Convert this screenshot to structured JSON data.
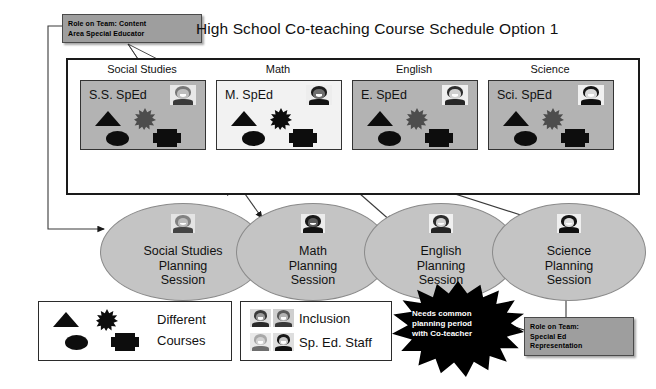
{
  "page_title": "High School Co-teaching Course Schedule Option 1",
  "role_top": {
    "line1": "Role on Team: Content",
    "line2": "Area Special Educator"
  },
  "role_bottom": {
    "line1": "Role on Team:",
    "line2": "Special Ed",
    "line3": "Representation"
  },
  "subjects": [
    {
      "label": "Social Studies",
      "card_label": "S.S. SpEd",
      "card_style": "gray"
    },
    {
      "label": "Math",
      "card_label": "M. SpEd",
      "card_style": "light"
    },
    {
      "label": "English",
      "card_label": "E. SpEd",
      "card_style": "gray"
    },
    {
      "label": "Science",
      "card_label": "Sci. SpEd",
      "card_style": "gray"
    }
  ],
  "sessions": [
    {
      "line1": "Social Studies",
      "line2": "Planning",
      "line3": "Session"
    },
    {
      "line1": "Math",
      "line2": "Planning",
      "line3": "Session"
    },
    {
      "line1": "English",
      "line2": "Planning",
      "line3": "Session"
    },
    {
      "line1": "Science",
      "line2": "Planning",
      "line3": "Session"
    }
  ],
  "legend_courses": {
    "line1": "Different",
    "line2": "Courses"
  },
  "legend_people": {
    "row1_label": "Inclusion",
    "row2_label": "Sp. Ed. Staff"
  },
  "burst": {
    "line1": "Needs common",
    "line2": "planning period",
    "line3": "with Co-teacher"
  },
  "colors": {
    "card_gray": "#b3b3b3",
    "card_light": "#f2f2f2",
    "session_gray": "#c4c4c4",
    "role_gray": "#9e9e9e",
    "symbol_black": "#0d0d0d",
    "burst_black": "#000000"
  }
}
